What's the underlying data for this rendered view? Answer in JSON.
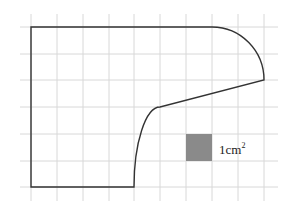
{
  "diagram": {
    "type": "grid-area-shape",
    "grid": {
      "columns": 10,
      "rows": 7,
      "cell_width_px": 25.8,
      "cell_height_px": 26.8,
      "origin_x": 31,
      "origin_y": 27,
      "line_color": "#d8d8d8"
    },
    "shape": {
      "stroke_color": "#333333",
      "description": "Composite figure: rectangle top-left with quarter-ellipse arc at top-right, straight slanted edge, and concave curve down to bottom edge"
    },
    "unit_square": {
      "fill_color": "#8a8a8a",
      "label_number": "1",
      "label_unit": "cm",
      "label_exponent": "2"
    }
  }
}
